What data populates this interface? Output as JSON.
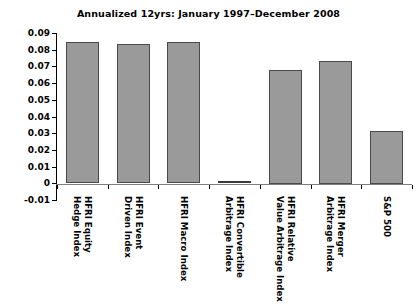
{
  "chart_data": {
    "type": "bar",
    "title": "Annualized 12yrs: January 1997–December 2008",
    "xlabel": "",
    "ylabel": "",
    "ylim": [
      -0.01,
      0.09
    ],
    "ytick_labels": [
      "0.09",
      "0.08",
      "0.07",
      "0.06",
      "0.05",
      "0.04",
      "0.03",
      "0.02",
      "0.01",
      "0",
      "-0.01"
    ],
    "ytick_values": [
      0.09,
      0.08,
      0.07,
      0.06,
      0.05,
      0.04,
      0.03,
      0.02,
      0.01,
      0,
      -0.01
    ],
    "grid": false,
    "legend": null,
    "bar_color": "#9a9a9a",
    "bar_edge_color": "#4a4a4a",
    "categories": [
      "HFRI Equity Hedge Index",
      "HFRI Event Driven Index",
      "HFRI Macro Index",
      "HFRI Convertible Arbitrage Index",
      "HFRI Relative Value Arbitrage Index",
      "HFRI Merger Arbitrage Index",
      "S&P 500"
    ],
    "category_lines": [
      [
        "HFRI Equity",
        "Hedge Index"
      ],
      [
        "HFRI Event",
        "Driven Index"
      ],
      [
        "HFRI Macro Index"
      ],
      [
        "HFRI Convertible",
        "Arbitrage Index"
      ],
      [
        "HFRI Relative",
        "Value Arbitrage Index"
      ],
      [
        "HFRI Merger",
        "Arbitrage Index"
      ],
      [
        "S&P 500"
      ]
    ],
    "values": [
      0.0845,
      0.0835,
      0.0845,
      0.0005,
      0.068,
      0.0735,
      0.0315
    ]
  }
}
